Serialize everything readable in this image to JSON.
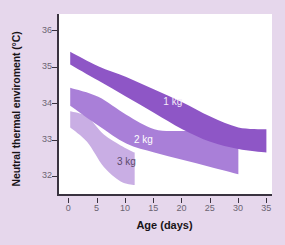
{
  "chart_data": {
    "type": "area",
    "title": "",
    "xlabel": "Age (days)",
    "ylabel": "Neutral thermal enviroment (°C)",
    "xlim": [
      -2,
      36
    ],
    "ylim": [
      31.45,
      36.45
    ],
    "xticks": [
      "0",
      "5",
      "10",
      "15",
      "20",
      "25",
      "30",
      "35"
    ],
    "xtick_values": [
      0,
      5,
      10,
      15,
      20,
      25,
      30,
      35
    ],
    "yticks": [
      "36",
      "35",
      "34",
      "33",
      "32"
    ],
    "ytick_values": [
      36,
      35,
      34,
      33,
      32
    ],
    "grid": false,
    "legend": "inline-band-labels",
    "series": [
      {
        "name": "1 kg",
        "label": "1 kg",
        "color": "#8e56c6",
        "label_color": "#f4ecf9",
        "x": [
          0,
          5,
          10,
          15,
          20,
          25,
          30,
          35
        ],
        "upper": [
          35.4,
          35.0,
          34.7,
          34.35,
          34.0,
          33.6,
          33.3,
          33.25
        ],
        "lower": [
          35.05,
          34.6,
          34.15,
          33.7,
          33.25,
          32.9,
          32.7,
          32.6
        ]
      },
      {
        "name": "2 kg",
        "label": "2 kg",
        "color": "#a97fd8",
        "label_color": "#ffffff",
        "x": [
          0,
          5,
          10,
          15,
          20,
          25,
          30
        ],
        "upper": [
          34.4,
          34.15,
          33.65,
          33.25,
          33.2,
          33.2,
          33.15
        ],
        "lower": [
          33.9,
          33.35,
          32.85,
          32.6,
          32.4,
          32.2,
          32.0
        ]
      },
      {
        "name": "3 kg",
        "label": "3 kg",
        "color": "#c9aee4",
        "label_color": "#5c4a6b",
        "x": [
          0,
          3,
          6,
          9,
          11.5
        ],
        "upper": [
          33.75,
          33.6,
          33.1,
          32.8,
          32.6
        ],
        "lower": [
          33.3,
          32.9,
          32.2,
          31.8,
          31.7
        ]
      }
    ],
    "band_labels": [
      {
        "text": "1 kg",
        "x": 16.8,
        "y": 34.02,
        "variant": "dark"
      },
      {
        "text": "2 kg",
        "x": 11.6,
        "y": 33.0,
        "variant": "mid"
      },
      {
        "text": "3 kg",
        "x": 8.6,
        "y": 32.38,
        "variant": "light"
      }
    ],
    "colors": {
      "background": "#e6d7ec",
      "plot_background": "#ffffff",
      "axis": "#3a3340",
      "tick_label": "#6b6472",
      "axis_title": "#181418",
      "band_1kg": "#8e56c6",
      "band_2kg": "#a97fd8",
      "band_3kg": "#c9aee4"
    }
  }
}
